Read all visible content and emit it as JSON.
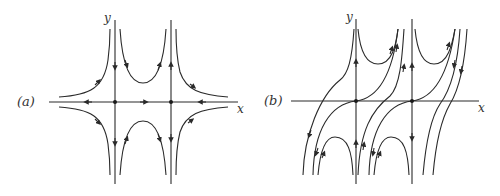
{
  "figure": {
    "panels": [
      {
        "id": "a",
        "label": "(a)",
        "x_axis_label": "x",
        "y_axis_label": "y",
        "fixed_points": 2,
        "description": "Two saddle points on the x-axis with vertical separatrices and hyperbolic trajectories"
      },
      {
        "id": "b",
        "label": "(b)",
        "x_axis_label": "x",
        "y_axis_label": "y",
        "fixed_points": 2,
        "description": "Two saddle points on the x-axis with sheared trajectories crossing the x-axis"
      }
    ]
  },
  "colors": {
    "ink": "#2a2a2a",
    "background": "#ffffff"
  }
}
